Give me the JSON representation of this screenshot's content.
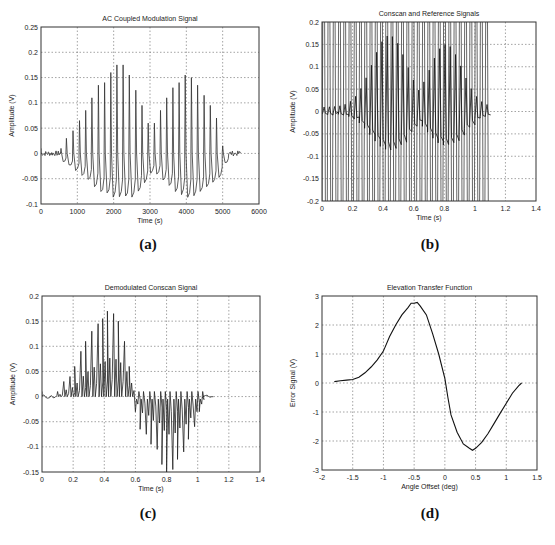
{
  "figure": {
    "caption_fragment": "",
    "sublabels": [
      "(a)",
      "(b)",
      "(c)",
      "(d)"
    ]
  },
  "chart_data": [
    {
      "id": "a",
      "type": "line",
      "title": "AC Coupled Modulation Signal",
      "xlabel": "Time (s)",
      "ylabel": "Amplitude (V)",
      "xlim": [
        0,
        6000
      ],
      "ylim": [
        -0.1,
        0.25
      ],
      "xticks": [
        0,
        1000,
        2000,
        3000,
        4000,
        5000,
        6000
      ],
      "xtick_labels": [
        "0",
        "1000",
        "2000",
        "3000",
        "4000",
        "5000",
        "6000"
      ],
      "yticks": [
        -0.1,
        -0.05,
        0,
        0.05,
        0.1,
        0.15,
        0.2,
        0.25
      ],
      "ytick_labels": [
        "-0.1",
        "-0.05",
        "0",
        "0.05",
        "0.1",
        "0.15",
        "0.2",
        "0.25"
      ],
      "grid": true,
      "signal": {
        "description": "Pulsed modulation with two amplitude lobes",
        "x_range": [
          0,
          5500
        ],
        "pulse_period": 170,
        "lobe_centers": [
          2250,
          4000
        ],
        "lobe_peaks": [
          0.175,
          0.155
        ],
        "trough_min": -0.085,
        "baseline_noise": 0.005
      },
      "peak_samples": {
        "x": [
          550,
          700,
          880,
          1060,
          1230,
          1400,
          1580,
          1750,
          1920,
          2090,
          2260,
          2430,
          2610,
          2780,
          2950,
          3120,
          3290,
          3460,
          3630,
          3800,
          3970,
          4140,
          4310,
          4490,
          4660,
          4830,
          5000
        ],
        "y": [
          0.01,
          0.03,
          0.045,
          0.065,
          0.085,
          0.11,
          0.135,
          0.14,
          0.16,
          0.175,
          0.175,
          0.155,
          0.125,
          0.095,
          0.06,
          0.06,
          0.085,
          0.11,
          0.13,
          0.14,
          0.155,
          0.15,
          0.135,
          0.115,
          0.095,
          0.07,
          0.015
        ]
      }
    },
    {
      "id": "b",
      "type": "line",
      "title": "Conscan and Reference Signals",
      "xlabel": "Time (s)",
      "ylabel": "Amplitude (V)",
      "xlim": [
        0,
        1.4
      ],
      "ylim": [
        -0.2,
        0.2
      ],
      "xticks": [
        0,
        0.2,
        0.4,
        0.6,
        0.8,
        1,
        1.2,
        1.4
      ],
      "xtick_labels": [
        "0",
        "0.2",
        "0.4",
        "0.6",
        "0.8",
        "1",
        "1.2",
        "1.4"
      ],
      "yticks": [
        -0.2,
        -0.15,
        -0.1,
        -0.05,
        0,
        0.05,
        0.1,
        0.15,
        0.2
      ],
      "ytick_labels": [
        "-0.2",
        "-0.15",
        "-0.1",
        "-0.05",
        "0",
        "0.05",
        "0.1",
        "0.15",
        "0.2"
      ],
      "grid": true,
      "series": [
        {
          "name": "Reference",
          "description": "square-ish oscillation clipped at ±0.2",
          "x_range": [
            0,
            1.1
          ],
          "cycles": 32,
          "amplitude": 0.2
        },
        {
          "name": "Conscan",
          "description": "AC signal envelope",
          "x_range": [
            0,
            1.1
          ],
          "lobe_centers": [
            0.43,
            0.8
          ],
          "lobe_peaks": [
            0.16,
            0.14
          ],
          "trough_min": -0.085
        }
      ]
    },
    {
      "id": "c",
      "type": "line",
      "title": "Demodulated Conscan Signal",
      "xlabel": "Time (s)",
      "ylabel": "Amplitude (V)",
      "xlim": [
        0,
        1.4
      ],
      "ylim": [
        -0.15,
        0.2
      ],
      "xticks": [
        0,
        0.2,
        0.4,
        0.6,
        0.8,
        1,
        1.2,
        1.4
      ],
      "xtick_labels": [
        "0",
        "0.2",
        "0.4",
        "0.6",
        "0.8",
        "1",
        "1.2",
        "1.4"
      ],
      "yticks": [
        -0.15,
        -0.1,
        -0.05,
        0,
        0.05,
        0.1,
        0.15,
        0.2
      ],
      "ytick_labels": [
        "-0.15",
        "-0.1",
        "-0.05",
        "0",
        "0.05",
        "0.1",
        "0.15",
        "0.2"
      ],
      "grid": true,
      "signal": {
        "x_range": [
          0,
          1.1
        ],
        "pulse_period": 0.0345,
        "positive_lobe_center": 0.43,
        "positive_lobe_peak": 0.17,
        "negative_lobe_center": 0.8,
        "negative_lobe_peak": -0.145
      },
      "peak_samples": {
        "x": [
          0.1,
          0.14,
          0.18,
          0.21,
          0.25,
          0.28,
          0.32,
          0.36,
          0.39,
          0.42,
          0.46,
          0.49,
          0.53,
          0.56,
          0.6,
          0.63,
          0.67,
          0.7,
          0.74,
          0.77,
          0.8,
          0.84,
          0.87,
          0.91,
          0.94,
          0.98,
          1.01
        ],
        "y": [
          0.01,
          0.03,
          0.04,
          0.06,
          0.09,
          0.11,
          0.13,
          0.145,
          0.155,
          0.17,
          0.165,
          0.15,
          0.11,
          0.06,
          -0.03,
          -0.065,
          -0.075,
          -0.095,
          -0.105,
          -0.135,
          -0.15,
          -0.145,
          -0.125,
          -0.11,
          -0.085,
          -0.06,
          -0.03
        ]
      }
    },
    {
      "id": "d",
      "type": "line",
      "title": "Elevation Transfer Function",
      "xlabel": "Angle Offset (deg)",
      "ylabel": "Error Signal (V)",
      "xlim": [
        -2,
        1.5
      ],
      "ylim": [
        -3,
        3
      ],
      "xticks": [
        -2,
        -1.5,
        -1,
        -0.5,
        0,
        0.5,
        1,
        1.5
      ],
      "xtick_labels": [
        "-2",
        "-1.5",
        "-1",
        "-0.5",
        "0",
        "0.5",
        "1",
        "1.5"
      ],
      "yticks": [
        -3,
        -2,
        -1,
        0,
        1,
        2,
        3
      ],
      "ytick_labels": [
        "-3",
        "-2",
        "-1",
        "0",
        "1",
        "2",
        "3"
      ],
      "grid": true,
      "x": [
        -1.8,
        -1.7,
        -1.6,
        -1.5,
        -1.4,
        -1.3,
        -1.2,
        -1.1,
        -1.0,
        -0.9,
        -0.8,
        -0.7,
        -0.6,
        -0.55,
        -0.5,
        -0.45,
        -0.4,
        -0.3,
        -0.2,
        -0.1,
        0.0,
        0.05,
        0.1,
        0.2,
        0.3,
        0.4,
        0.45,
        0.5,
        0.6,
        0.7,
        0.8,
        0.9,
        1.0,
        1.1,
        1.2,
        1.25
      ],
      "y": [
        0.05,
        0.08,
        0.1,
        0.12,
        0.2,
        0.35,
        0.55,
        0.8,
        1.1,
        1.6,
        2.0,
        2.35,
        2.6,
        2.75,
        2.75,
        2.78,
        2.65,
        2.35,
        1.7,
        1.0,
        0.15,
        -0.5,
        -1.1,
        -1.7,
        -2.1,
        -2.25,
        -2.32,
        -2.25,
        -2.05,
        -1.75,
        -1.4,
        -1.05,
        -0.7,
        -0.35,
        -0.1,
        0.0
      ]
    }
  ]
}
